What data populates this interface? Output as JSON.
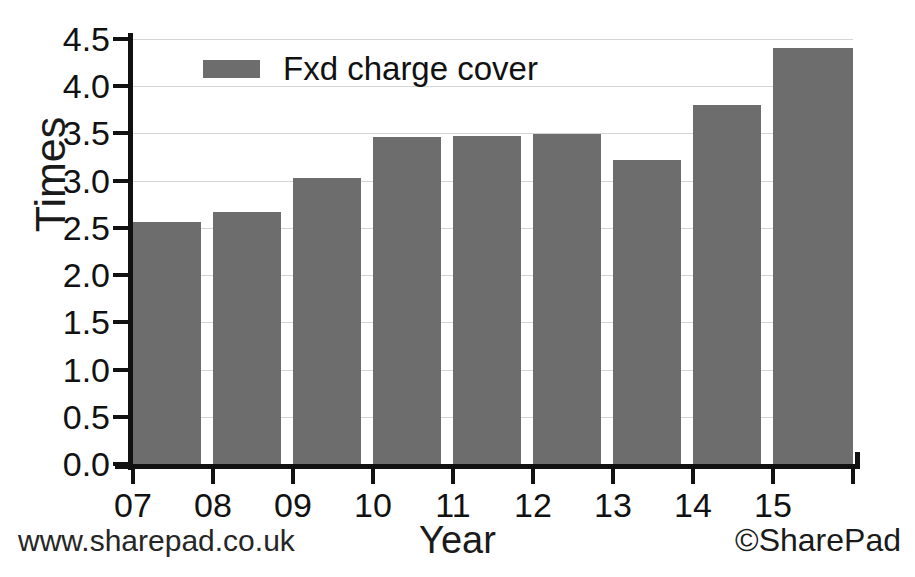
{
  "chart_data": {
    "type": "bar",
    "title": "",
    "xlabel": "Year",
    "ylabel": "Times",
    "categories": [
      "07",
      "08",
      "09",
      "10",
      "11",
      "12",
      "13",
      "14",
      "15"
    ],
    "series": [
      {
        "name": "Fxd charge cover",
        "color": "#6d6d6d",
        "values": [
          2.56,
          2.67,
          3.03,
          3.46,
          3.47,
          3.49,
          3.22,
          3.8,
          4.4
        ]
      }
    ],
    "ylim": [
      0.0,
      4.5
    ],
    "yticks": [
      "0.0",
      "0.5",
      "1.0",
      "1.5",
      "2.0",
      "2.5",
      "3.0",
      "3.5",
      "4.0",
      "4.5"
    ],
    "ytick_values": [
      0.0,
      0.5,
      1.0,
      1.5,
      2.0,
      2.5,
      3.0,
      3.5,
      4.0,
      4.5
    ],
    "grid": true,
    "legend_position": "top-left",
    "legend": [
      "Fxd charge cover"
    ]
  },
  "legend": {
    "label": "Fxd charge cover",
    "swatch_color": "#6d6d6d"
  },
  "footer": {
    "left": "www.sharepad.co.uk",
    "right": "©SharePad"
  },
  "axes": {
    "y_title": "Times",
    "x_title": "Year"
  }
}
